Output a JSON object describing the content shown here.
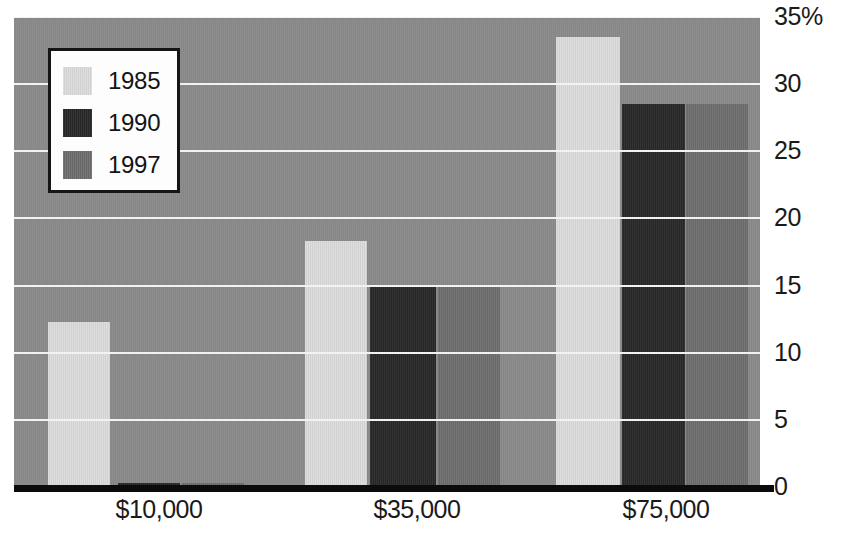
{
  "chart_data": {
    "type": "bar",
    "title": "",
    "subtitle": "",
    "xlabel": "",
    "ylabel": "",
    "categories": [
      "$10,000",
      "$35,000",
      "$75,000"
    ],
    "series": [
      {
        "name": "1985",
        "color": "#dcdcdc",
        "values": [
          12.3,
          18.3,
          33.5
        ]
      },
      {
        "name": "1990",
        "color": "#282828",
        "values": [
          0.3,
          15.0,
          28.5
        ]
      },
      {
        "name": "1997",
        "color": "#6e6e6e",
        "values": [
          0.3,
          15.0,
          28.5
        ]
      }
    ],
    "ylim": [
      0,
      35
    ],
    "y_ticks": [
      0,
      5,
      10,
      15,
      20,
      25,
      30,
      35
    ],
    "y_tick_labels": [
      "0",
      "5",
      "10",
      "15",
      "20",
      "25",
      "30",
      "35%"
    ],
    "grid": true,
    "grid_color": "#f2f2f2",
    "grid_axis": "y",
    "legend": {
      "position": "top-left",
      "entries": [
        "1985",
        "1990",
        "1997"
      ]
    },
    "plot_background": "#8a8a8a",
    "axis_color": "#0b0b0b",
    "orientation": "vertical",
    "grouping": "grouped"
  },
  "legend": {
    "entries": [
      {
        "label": "1985",
        "color": "#dcdcdc"
      },
      {
        "label": "1990",
        "color": "#282828"
      },
      {
        "label": "1997",
        "color": "#6e6e6e"
      }
    ]
  },
  "axes": {
    "y_tick_labels": [
      "35%",
      "30",
      "25",
      "20",
      "15",
      "10",
      "5",
      "0"
    ],
    "x_tick_labels": [
      "$10,000",
      "$35,000",
      "$75,000"
    ]
  },
  "geometry": {
    "plot": {
      "left": 14,
      "top": 17,
      "width": 746,
      "height": 470
    },
    "value_max": 35,
    "baseline_y": 487,
    "px_per_unit": 13.4,
    "bar_groups": [
      {
        "category": "$10,000",
        "label_center_x": 145,
        "bars": [
          {
            "series": "1985",
            "x": 34,
            "w": 62
          },
          {
            "series": "1990",
            "x": 104,
            "w": 62
          },
          {
            "series": "1997",
            "x": 168,
            "w": 62
          }
        ]
      },
      {
        "category": "$35,000",
        "label_center_x": 403,
        "bars": [
          {
            "series": "1985",
            "x": 291,
            "w": 62
          },
          {
            "series": "1990",
            "x": 356,
            "w": 66
          },
          {
            "series": "1997",
            "x": 424,
            "w": 62
          }
        ]
      },
      {
        "category": "$75,000",
        "label_center_x": 652,
        "bars": [
          {
            "series": "1985",
            "x": 542,
            "w": 64
          },
          {
            "series": "1990",
            "x": 608,
            "w": 63
          },
          {
            "series": "1997",
            "x": 672,
            "w": 62
          }
        ]
      }
    ]
  }
}
